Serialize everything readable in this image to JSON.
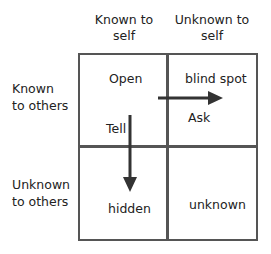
{
  "columns": [
    {
      "line1": "Known to",
      "line2": "self"
    },
    {
      "line1": "Unknown to",
      "line2": "self"
    }
  ],
  "rows": [
    {
      "line1": "Known",
      "line2": "to others"
    },
    {
      "line1": "Unknown",
      "line2": "to others"
    }
  ],
  "quadrants": {
    "open": "Open",
    "blind_spot": "blind spot",
    "hidden": "hidden",
    "unknown": "unknown"
  },
  "arrows": {
    "tell": "Tell",
    "ask": "Ask"
  },
  "colors": {
    "border": "#555555",
    "arrow": "#333333",
    "text": "#222222"
  }
}
